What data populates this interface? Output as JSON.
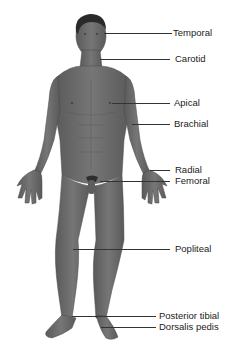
{
  "diagram": {
    "colors": {
      "skin": "#6e6e6e",
      "skin_shadow": "#555555",
      "hair": "#2a2a2a",
      "leader_line": "#333333",
      "text": "#222222",
      "background": "#ffffff"
    },
    "labels": [
      {
        "id": "temporal",
        "text": "Temporal",
        "line_y": 33,
        "line_x1": 104,
        "line_x2": 172,
        "text_x": 173
      },
      {
        "id": "carotid",
        "text": "Carotid",
        "line_y": 59,
        "line_x1": 100,
        "line_x2": 170,
        "text_x": 175
      },
      {
        "id": "apical",
        "text": "Apical",
        "line_y": 103,
        "line_x1": 112,
        "line_x2": 170,
        "text_x": 174
      },
      {
        "id": "brachial",
        "text": "Brachial",
        "line_y": 124,
        "line_x1": 132,
        "line_x2": 170,
        "text_x": 174
      },
      {
        "id": "radial",
        "text": "Radial",
        "line_y": 170,
        "line_x1": 150,
        "line_x2": 170,
        "text_x": 175
      },
      {
        "id": "femoral",
        "text": "Femoral",
        "line_y": 181,
        "line_x1": 100,
        "line_x2": 170,
        "text_x": 175
      },
      {
        "id": "popliteal",
        "text": "Popliteal",
        "line_y": 249,
        "line_x1": 73,
        "line_x2": 170,
        "text_x": 175
      },
      {
        "id": "posterior-tibial",
        "text": "Posterior tibial",
        "line_y": 316,
        "line_x1": 72,
        "line_x2": 156,
        "text_x": 159
      },
      {
        "id": "dorsalis-pedis",
        "text": "Dorsalis pedis",
        "line_y": 327,
        "line_x1": 101,
        "line_x2": 156,
        "text_x": 159
      }
    ]
  }
}
